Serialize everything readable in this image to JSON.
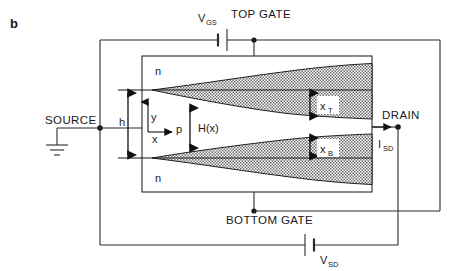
{
  "figure": {
    "panel_label": "b",
    "type": "device-cross-section-circuit-schematic"
  },
  "labels": {
    "top_gate": "TOP GATE",
    "bottom_gate": "BOTTOM GATE",
    "source": "SOURCE",
    "drain": "DRAIN",
    "vgs": "V",
    "vgs_sub": "GS",
    "vsd": "V",
    "vsd_sub": "SD",
    "isd": "I",
    "isd_sub": "SD",
    "region_n_top": "n",
    "region_n_bottom": "n",
    "region_p": "p",
    "channel_height": "H(x)",
    "half_thickness": "h",
    "depletion_top": "x",
    "depletion_top_sub": "T",
    "depletion_bottom": "x",
    "depletion_bottom_sub": "B",
    "axis_x": "x",
    "axis_y": "y"
  },
  "icons": {
    "ground": "ground-symbol",
    "battery_vgs": "battery-cell-symbol",
    "battery_vsd": "battery-cell-symbol",
    "current_arrow": "right-arrow-current",
    "dimension_arrow_h": "double-headed-arrow-vertical",
    "dimension_arrow_hx": "double-headed-arrow-vertical",
    "dimension_arrow_xt": "double-headed-arrow-vertical",
    "dimension_arrow_xb": "double-headed-arrow-vertical",
    "axis_arrow_x": "single-headed-arrow-right",
    "axis_arrow_y": "single-headed-arrow-up"
  },
  "colors": {
    "line": "#2b2b2b",
    "text": "#1a1a1a",
    "shading": "#8a8a8a",
    "background": "#ffffff"
  },
  "geometry": {
    "device_rect": {
      "x": 142,
      "y": 56,
      "width": 230,
      "height": 136
    },
    "junction_top_y": 90,
    "junction_bottom_y": 158,
    "depletion_apex_x": 152,
    "channel_center_y": 124
  }
}
